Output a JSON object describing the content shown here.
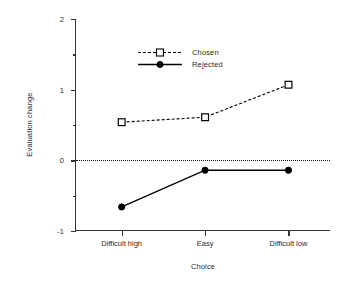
{
  "chart_data": {
    "type": "line",
    "title": "",
    "xlabel": "Choice",
    "ylabel": "Evaluation change",
    "categories": [
      "Difficult high",
      "Easy",
      "Difficult low"
    ],
    "series": [
      {
        "name": "Chosen",
        "values": [
          0.54,
          0.61,
          1.07
        ],
        "linestyle": "dashed",
        "marker": "open-square",
        "color": "#000000"
      },
      {
        "name": "Rejected",
        "values": [
          -0.66,
          -0.14,
          -0.14
        ],
        "linestyle": "solid",
        "marker": "filled-circle",
        "color": "#000000"
      }
    ],
    "ylim": [
      -1,
      2
    ],
    "yticks": [
      -1,
      0,
      1,
      2
    ],
    "ytick_labels": [
      "-1",
      "0",
      "1",
      "2"
    ],
    "yticks_minor": [
      -0.5,
      0.5,
      1.5
    ],
    "grid": false,
    "reference_line": {
      "value": 0,
      "style": "dotted"
    },
    "legend_position": "upper-left-inside",
    "spines": [
      "left",
      "bottom"
    ]
  },
  "legend": {
    "entries": [
      {
        "label": "Chosen"
      },
      {
        "label": "Rejected"
      }
    ]
  },
  "colors": {
    "axis": "#333333",
    "text": "#2b2b2b",
    "data": "#000000",
    "background": "#ffffff"
  }
}
